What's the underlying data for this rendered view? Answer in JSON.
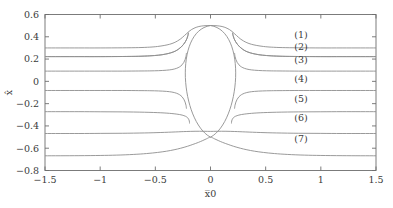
{
  "chart_data": {
    "type": "line",
    "title": "",
    "subtitle": "",
    "xlabel": "x̅0",
    "ylabel": "x̂",
    "xlim": [
      -1.5,
      1.5
    ],
    "ylim": [
      -0.8,
      0.6
    ],
    "grid": false,
    "legend_position": "inline-right",
    "xticks": [
      -1.5,
      -1,
      -0.5,
      0,
      0.5,
      1,
      1.5
    ],
    "xtick_labels": [
      "−1.5",
      "−1",
      "−0.5",
      "0",
      "0.5",
      "1",
      "1.5"
    ],
    "yticks": [
      0.6,
      0.4,
      0.2,
      0,
      -0.2,
      -0.4,
      -0.6,
      -0.8
    ],
    "ytick_labels": [
      "0.6",
      "0.4",
      "0.2",
      "0",
      "−0.2",
      "−0.4",
      "−0.6",
      "−0.8"
    ],
    "annotations": [
      {
        "text": "(1)",
        "x": 0.82,
        "y": 0.385
      },
      {
        "text": "(2)",
        "x": 0.82,
        "y": 0.285
      },
      {
        "text": "(3)",
        "x": 0.82,
        "y": 0.165
      },
      {
        "text": "(4)",
        "x": 0.82,
        "y": -0.005
      },
      {
        "text": "(5)",
        "x": 0.82,
        "y": -0.185
      },
      {
        "text": "(6)",
        "x": 0.82,
        "y": -0.355
      },
      {
        "text": "(7)",
        "x": 0.82,
        "y": -0.545
      }
    ],
    "series": [
      {
        "name": "(1)",
        "left_asymptote": 0.3,
        "right_asymptote": 0.3,
        "points": [
          [
            -1.5,
            0.3
          ],
          [
            -1.2,
            0.3
          ],
          [
            -1.0,
            0.3
          ],
          [
            -0.8,
            0.301
          ],
          [
            -0.65,
            0.303
          ],
          [
            -0.55,
            0.307
          ],
          [
            -0.48,
            0.313
          ],
          [
            -0.42,
            0.322
          ],
          [
            -0.37,
            0.333
          ],
          [
            -0.33,
            0.347
          ],
          [
            -0.3,
            0.362
          ],
          [
            -0.275,
            0.378
          ],
          [
            -0.255,
            0.394
          ],
          [
            -0.235,
            0.412
          ],
          [
            -0.215,
            0.43
          ],
          [
            -0.195,
            0.448
          ],
          [
            -0.17,
            0.466
          ],
          [
            -0.14,
            0.481
          ],
          [
            -0.105,
            0.492
          ],
          [
            -0.06,
            0.499
          ],
          [
            0.0,
            0.501
          ],
          [
            0.06,
            0.499
          ],
          [
            0.105,
            0.492
          ],
          [
            0.14,
            0.481
          ],
          [
            0.17,
            0.466
          ],
          [
            0.195,
            0.448
          ],
          [
            0.215,
            0.43
          ],
          [
            0.235,
            0.412
          ],
          [
            0.255,
            0.394
          ],
          [
            0.275,
            0.378
          ],
          [
            0.3,
            0.362
          ],
          [
            0.33,
            0.347
          ],
          [
            0.37,
            0.333
          ],
          [
            0.42,
            0.322
          ],
          [
            0.48,
            0.313
          ],
          [
            0.55,
            0.307
          ],
          [
            0.65,
            0.303
          ],
          [
            0.8,
            0.301
          ],
          [
            1.0,
            0.3
          ],
          [
            1.2,
            0.3
          ],
          [
            1.5,
            0.3
          ]
        ]
      },
      {
        "name": "(2)",
        "left_asymptote": 0.222,
        "right_asymptote": 0.222,
        "points": [
          [
            -1.5,
            0.222
          ],
          [
            -1.2,
            0.222
          ],
          [
            -1.0,
            0.222
          ],
          [
            -0.8,
            0.223
          ],
          [
            -0.65,
            0.225
          ],
          [
            -0.55,
            0.229
          ],
          [
            -0.47,
            0.235
          ],
          [
            -0.41,
            0.244
          ],
          [
            -0.36,
            0.256
          ],
          [
            -0.32,
            0.271
          ],
          [
            -0.29,
            0.289
          ],
          [
            -0.265,
            0.309
          ],
          [
            -0.245,
            0.331
          ],
          [
            -0.228,
            0.355
          ],
          [
            -0.214,
            0.382
          ],
          [
            -0.205,
            0.41
          ],
          [
            -0.2,
            0.436
          ],
          [
            -0.2,
            0.436
          ],
          [
            -0.205,
            0.41
          ],
          [
            -0.214,
            0.382
          ],
          [
            -0.228,
            0.355
          ],
          [
            -0.245,
            0.331
          ],
          [
            -0.265,
            0.309
          ],
          [
            -0.29,
            0.289
          ],
          [
            -0.32,
            0.271
          ],
          [
            -0.36,
            0.256
          ],
          [
            -0.41,
            0.244
          ],
          [
            -0.47,
            0.235
          ],
          [
            -0.55,
            0.229
          ],
          [
            -0.65,
            0.225
          ],
          [
            -0.8,
            0.223
          ],
          [
            -1.0,
            0.222
          ],
          [
            -1.2,
            0.222
          ],
          [
            -1.5,
            0.222
          ]
        ]
      },
      {
        "name": "(3)",
        "left_asymptote": 0.092,
        "right_asymptote": 0.092,
        "points": [
          [
            -1.5,
            0.092
          ],
          [
            -1.2,
            0.092
          ],
          [
            -1.0,
            0.092
          ],
          [
            -0.8,
            0.092
          ],
          [
            -0.65,
            0.093
          ],
          [
            -0.55,
            0.094
          ],
          [
            -0.47,
            0.096
          ],
          [
            -0.4,
            0.1
          ],
          [
            -0.35,
            0.106
          ],
          [
            -0.31,
            0.116
          ],
          [
            -0.28,
            0.13
          ],
          [
            -0.258,
            0.148
          ],
          [
            -0.242,
            0.17
          ],
          [
            -0.23,
            0.196
          ],
          [
            -0.222,
            0.225
          ],
          [
            -0.218,
            0.255
          ]
        ]
      },
      {
        "name": "(4)",
        "left_asymptote": -0.082,
        "right_asymptote": -0.082,
        "points": [
          [
            -1.5,
            -0.082
          ],
          [
            -1.2,
            -0.082
          ],
          [
            -1.0,
            -0.082
          ],
          [
            -0.8,
            -0.082
          ],
          [
            -0.65,
            -0.083
          ],
          [
            -0.55,
            -0.084
          ],
          [
            -0.47,
            -0.086
          ],
          [
            -0.4,
            -0.09
          ],
          [
            -0.35,
            -0.096
          ],
          [
            -0.31,
            -0.106
          ],
          [
            -0.28,
            -0.12
          ],
          [
            -0.258,
            -0.138
          ],
          [
            -0.242,
            -0.16
          ],
          [
            -0.23,
            -0.186
          ],
          [
            -0.222,
            -0.215
          ],
          [
            -0.218,
            -0.245
          ]
        ]
      },
      {
        "name": "(5)",
        "left_asymptote": -0.272,
        "right_asymptote": -0.272,
        "points": [
          [
            -1.5,
            -0.272
          ],
          [
            -1.2,
            -0.272
          ],
          [
            -1.0,
            -0.273
          ],
          [
            -0.8,
            -0.274
          ],
          [
            -0.6,
            -0.277
          ],
          [
            -0.45,
            -0.282
          ],
          [
            -0.35,
            -0.289
          ],
          [
            -0.28,
            -0.298
          ],
          [
            -0.24,
            -0.308
          ],
          [
            -0.215,
            -0.32
          ],
          [
            -0.2,
            -0.336
          ],
          [
            -0.192,
            -0.356
          ],
          [
            -0.19,
            -0.378
          ]
        ]
      },
      {
        "name": "(6)",
        "left_asymptote": -0.468,
        "right_asymptote": -0.468,
        "points": [
          [
            -1.5,
            -0.468
          ],
          [
            -1.2,
            -0.468
          ],
          [
            -1.0,
            -0.467
          ],
          [
            -0.8,
            -0.466
          ],
          [
            -0.6,
            -0.463
          ],
          [
            -0.45,
            -0.459
          ],
          [
            -0.32,
            -0.454
          ],
          [
            -0.22,
            -0.45
          ],
          [
            -0.14,
            -0.448
          ],
          [
            -0.06,
            -0.448
          ],
          [
            0.0,
            -0.449
          ],
          [
            0.06,
            -0.448
          ],
          [
            0.14,
            -0.448
          ],
          [
            0.22,
            -0.45
          ],
          [
            0.32,
            -0.454
          ],
          [
            0.45,
            -0.459
          ],
          [
            0.6,
            -0.463
          ],
          [
            0.8,
            -0.466
          ],
          [
            1.0,
            -0.467
          ],
          [
            1.2,
            -0.468
          ],
          [
            1.5,
            -0.468
          ]
        ]
      },
      {
        "name": "(7)",
        "left_asymptote": -0.668,
        "right_asymptote": -0.668,
        "points": [
          [
            -1.5,
            -0.668
          ],
          [
            -1.2,
            -0.667
          ],
          [
            -1.0,
            -0.665
          ],
          [
            -0.85,
            -0.662
          ],
          [
            -0.7,
            -0.656
          ],
          [
            -0.58,
            -0.648
          ],
          [
            -0.48,
            -0.638
          ],
          [
            -0.4,
            -0.627
          ],
          [
            -0.33,
            -0.614
          ],
          [
            -0.27,
            -0.6
          ],
          [
            -0.21,
            -0.583
          ],
          [
            -0.16,
            -0.566
          ],
          [
            -0.11,
            -0.548
          ],
          [
            -0.07,
            -0.531
          ],
          [
            -0.035,
            -0.515
          ],
          [
            0.0,
            -0.501
          ],
          [
            0.035,
            -0.515
          ],
          [
            0.07,
            -0.531
          ],
          [
            0.11,
            -0.548
          ],
          [
            0.16,
            -0.566
          ],
          [
            0.21,
            -0.583
          ],
          [
            0.27,
            -0.6
          ],
          [
            0.33,
            -0.614
          ],
          [
            0.4,
            -0.627
          ],
          [
            0.48,
            -0.638
          ],
          [
            0.58,
            -0.648
          ],
          [
            0.7,
            -0.656
          ],
          [
            0.85,
            -0.662
          ],
          [
            1.0,
            -0.665
          ],
          [
            1.2,
            -0.667
          ],
          [
            1.5,
            -0.668
          ]
        ]
      }
    ],
    "center_lens": {
      "name": "central-lens",
      "description": "closed lens/ellipse shape centered at x=0 spanning y from -0.50 to 0.50",
      "x_half_width": 0.255,
      "y_top": 0.501,
      "y_bottom": -0.501
    }
  },
  "figure": {
    "background": "#ffffff",
    "curve_color": "#8e8e8e",
    "axis_color": "#6e6e6e",
    "text_color": "#3b3b3b"
  }
}
